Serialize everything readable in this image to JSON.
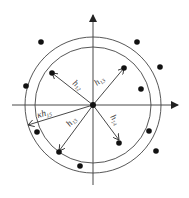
{
  "diagram": {
    "title": "",
    "center": {
      "x": 93,
      "y": 105
    },
    "axes": {
      "x": {
        "x1": 12,
        "y": 105,
        "x2": 178
      },
      "y": {
        "x": 93,
        "y1": 185,
        "y2": 15
      }
    },
    "circles": {
      "inner": {
        "r": 58,
        "label": "inner ball"
      },
      "outer": {
        "r": 68,
        "label": "outer ball"
      }
    },
    "arrows": [
      {
        "id": "h12-upper-left",
        "label": "h",
        "subscript": "12",
        "x2": 52,
        "y2": 73,
        "lx": 72,
        "ly": 84,
        "angle": 38
      },
      {
        "id": "h13-upper-right",
        "label": "h",
        "subscript": "13",
        "x2": 124,
        "y2": 68,
        "lx": 97,
        "ly": 86,
        "angle": -40
      },
      {
        "id": "kh15-left",
        "label": "κh",
        "subscript": "15",
        "x2": 28,
        "y2": 125,
        "lx": 38,
        "ly": 118,
        "angle": -16
      },
      {
        "id": "h13-lower-left",
        "label": "h",
        "subscript": "13",
        "x2": 59,
        "y2": 151,
        "lx": 70,
        "ly": 127,
        "angle": -50
      },
      {
        "id": "h14-lower-right",
        "label": "h",
        "subscript": "14",
        "x2": 119,
        "y2": 140,
        "lx": 110,
        "ly": 117,
        "angle": 55
      }
    ],
    "points": [
      {
        "x": 41,
        "y": 42
      },
      {
        "x": 137,
        "y": 42
      },
      {
        "x": 52,
        "y": 73
      },
      {
        "x": 124,
        "y": 68
      },
      {
        "x": 160,
        "y": 67
      },
      {
        "x": 26,
        "y": 86
      },
      {
        "x": 141,
        "y": 89
      },
      {
        "x": 37,
        "y": 132
      },
      {
        "x": 149,
        "y": 131
      },
      {
        "x": 59,
        "y": 152
      },
      {
        "x": 119,
        "y": 143
      },
      {
        "x": 156,
        "y": 151
      },
      {
        "x": 80,
        "y": 166
      }
    ],
    "colors": {
      "stroke": "#333333",
      "point": "#111111",
      "background": "#ffffff"
    }
  }
}
